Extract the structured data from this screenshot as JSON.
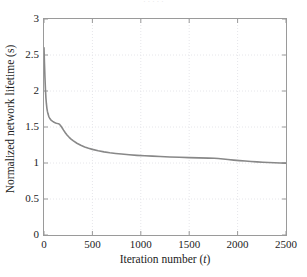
{
  "figure": {
    "background_color": "#ffffff",
    "frame_color": "#9a9a9a",
    "grid_color": "#e6e6ea",
    "top_clipped_text": "· · · · ·"
  },
  "chart_data": {
    "type": "line",
    "title": "",
    "subtitle": "",
    "xlabel": "Iteration number (t)",
    "xlabel_plain": "Iteration number",
    "xlabel_variable": "t",
    "ylabel": "Normalized network lifetime (s)",
    "xlim": [
      0,
      2500
    ],
    "ylim": [
      0,
      3
    ],
    "xticks": [
      0,
      500,
      1000,
      1500,
      2000,
      2500
    ],
    "xtick_labels": [
      "0",
      "500",
      "1000",
      "1500",
      "2000",
      "2500"
    ],
    "yticks": [
      0,
      0.5,
      1,
      1.5,
      2,
      2.5,
      3
    ],
    "ytick_labels": [
      "0",
      "0.5",
      "1",
      "1.5",
      "2",
      "2.5",
      "3"
    ],
    "grid": true,
    "grid_style": "dotted",
    "legend": null,
    "legend_position": "none",
    "series": [
      {
        "name": "Normalized network lifetime",
        "color": "#888888",
        "line_width": 1.6,
        "x": [
          0,
          5,
          10,
          15,
          20,
          25,
          30,
          35,
          40,
          45,
          50,
          60,
          70,
          80,
          90,
          100,
          110,
          120,
          130,
          140,
          150,
          160,
          170,
          180,
          190,
          200,
          220,
          240,
          260,
          280,
          300,
          340,
          380,
          420,
          460,
          500,
          560,
          620,
          680,
          740,
          800,
          880,
          960,
          1040,
          1120,
          1200,
          1300,
          1400,
          1500,
          1600,
          1700,
          1760,
          1800,
          1850,
          1900,
          1960,
          2020,
          2080,
          2140,
          2200,
          2260,
          2320,
          2380,
          2440,
          2500
        ],
        "y": [
          2.6,
          2.38,
          2.18,
          2.02,
          1.9,
          1.82,
          1.76,
          1.72,
          1.69,
          1.665,
          1.645,
          1.618,
          1.6,
          1.588,
          1.578,
          1.57,
          1.563,
          1.557,
          1.552,
          1.548,
          1.546,
          1.537,
          1.522,
          1.503,
          1.482,
          1.46,
          1.42,
          1.386,
          1.357,
          1.332,
          1.31,
          1.274,
          1.246,
          1.223,
          1.205,
          1.189,
          1.17,
          1.155,
          1.143,
          1.133,
          1.124,
          1.114,
          1.106,
          1.1,
          1.095,
          1.09,
          1.084,
          1.079,
          1.075,
          1.071,
          1.068,
          1.067,
          1.062,
          1.055,
          1.048,
          1.04,
          1.033,
          1.027,
          1.021,
          1.016,
          1.011,
          1.007,
          1.003,
          1.0,
          0.998
        ]
      }
    ],
    "annotations": [
      {
        "text": "initial steep decay from 2.6 to ~1.55 within first 150 iterations",
        "x": 75,
        "y": 1.55
      },
      {
        "text": "curve converges toward 1.0 at t = 2500",
        "x": 2500,
        "y": 1.0
      }
    ]
  }
}
